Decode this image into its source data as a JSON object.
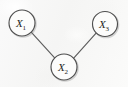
{
  "figure": {
    "kind": "undirected-graph-diagram",
    "width": 128,
    "height": 87,
    "background_color": "#f7f7f6",
    "node_fill_color": "#fcfcfb",
    "node_stroke_color": "#4f4f4f",
    "edge_color": "#5d5d5d",
    "label_color": "#242424"
  },
  "graph": {
    "nodes": [
      {
        "id": "X1",
        "base": "X",
        "subscript": "1",
        "cx": 22,
        "cy": 23,
        "r": 13
      },
      {
        "id": "X2",
        "base": "X",
        "subscript": "2",
        "cx": 64,
        "cy": 67,
        "r": 13
      },
      {
        "id": "X3",
        "base": "X",
        "subscript": "3",
        "cx": 105,
        "cy": 24,
        "r": 12.5
      }
    ],
    "edges": [
      {
        "id": "edge-x1-x2",
        "from": "X1",
        "to": "X2",
        "x1": 31.2,
        "y1": 32.2,
        "x2": 55.1,
        "y2": 58.4
      },
      {
        "id": "edge-x2-x3",
        "from": "X2",
        "to": "X3",
        "x1": 73.5,
        "y1": 58.4,
        "x2": 96.3,
        "y2": 32.9
      }
    ]
  }
}
